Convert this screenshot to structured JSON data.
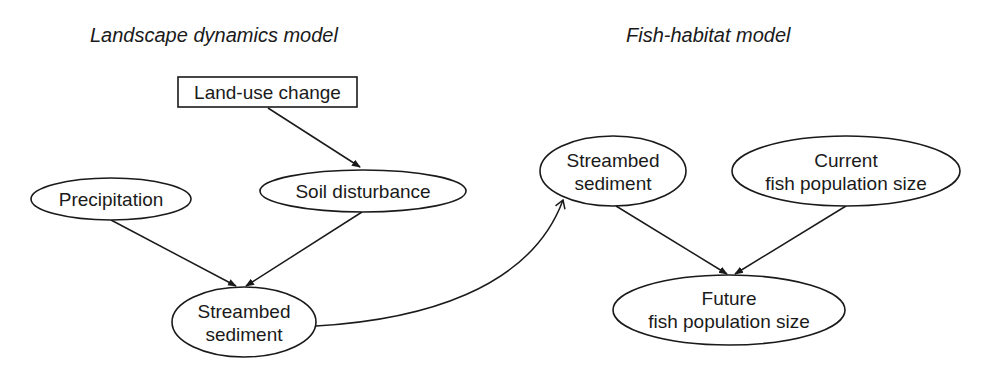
{
  "titles": {
    "left": "Landscape dynamics model",
    "right": "Fish-habitat model"
  },
  "nodes": {
    "land_use_change": {
      "shape": "rectangle",
      "lines": [
        "Land-use change"
      ]
    },
    "precipitation": {
      "shape": "ellipse",
      "lines": [
        "Precipitation"
      ]
    },
    "soil_disturbance": {
      "shape": "ellipse",
      "lines": [
        "Soil disturbance"
      ]
    },
    "streambed_sediment_left": {
      "shape": "ellipse",
      "lines": [
        "Streambed",
        "sediment"
      ]
    },
    "streambed_sediment_right": {
      "shape": "ellipse",
      "lines": [
        "Streambed",
        "sediment"
      ]
    },
    "current_fish_population": {
      "shape": "ellipse",
      "lines": [
        "Current",
        "fish population size"
      ]
    },
    "future_fish_population": {
      "shape": "ellipse",
      "lines": [
        "Future",
        "fish population size"
      ]
    }
  },
  "edges": [
    {
      "from": "land_use_change",
      "to": "soil_disturbance",
      "style": "straight"
    },
    {
      "from": "precipitation",
      "to": "streambed_sediment_left",
      "style": "straight"
    },
    {
      "from": "soil_disturbance",
      "to": "streambed_sediment_left",
      "style": "straight"
    },
    {
      "from": "streambed_sediment_left",
      "to": "streambed_sediment_right",
      "style": "curved",
      "arrowhead": "open"
    },
    {
      "from": "streambed_sediment_right",
      "to": "future_fish_population",
      "style": "straight"
    },
    {
      "from": "current_fish_population",
      "to": "future_fish_population",
      "style": "straight"
    }
  ],
  "colors": {
    "stroke": "#1a1a1a",
    "background": "#ffffff"
  }
}
